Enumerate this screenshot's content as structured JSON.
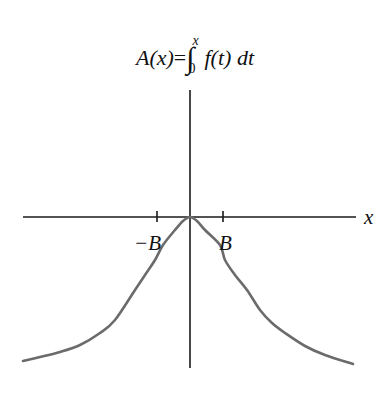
{
  "figure": {
    "title_lhs": "A(x)",
    "title_eq": "=",
    "integral_upper": "x",
    "integral_lower": "0",
    "integrand": "f(t) dt",
    "x_axis_label": "x",
    "tick_labels": [
      "−B",
      "B"
    ],
    "colors": {
      "axis": "#1a1a1a",
      "curve": "#6b6b6b",
      "background": "#ffffff"
    }
  },
  "chart_data": {
    "type": "line",
    "xlabel": "x",
    "ylabel": "",
    "xticks": [
      {
        "label": "−B",
        "value": -1
      },
      {
        "label": "B",
        "value": 1
      }
    ],
    "series": [
      {
        "name": "A(x)",
        "description": "even function, maximum 0 at x=0, inflection points at ±B, decreasing toward both sides",
        "points_px": [
          [
            23,
            361
          ],
          [
            40,
            357
          ],
          [
            60,
            352
          ],
          [
            80,
            345
          ],
          [
            100,
            333
          ],
          [
            115,
            320
          ],
          [
            135,
            290
          ],
          [
            145,
            275
          ],
          [
            155,
            260
          ],
          [
            163,
            245
          ],
          [
            175,
            230
          ],
          [
            183,
            221
          ],
          [
            190,
            217
          ],
          [
            197,
            221
          ],
          [
            205,
            230
          ],
          [
            220,
            245
          ],
          [
            225,
            260
          ],
          [
            235,
            275
          ],
          [
            247,
            290
          ],
          [
            260,
            310
          ],
          [
            272,
            323
          ],
          [
            285,
            333
          ],
          [
            305,
            346
          ],
          [
            325,
            355
          ],
          [
            353,
            364
          ]
        ]
      }
    ],
    "grid": false
  }
}
